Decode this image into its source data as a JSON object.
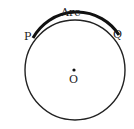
{
  "diagram": {
    "labels": {
      "arc": "Arc",
      "point_p": "P",
      "point_q": "Q",
      "center": "O"
    },
    "circle": {
      "cx": 75,
      "cy": 70,
      "r": 50,
      "stroke": "#222222"
    },
    "arc_highlight": {
      "from": "P",
      "to": "Q",
      "stroke": "#111111"
    }
  }
}
